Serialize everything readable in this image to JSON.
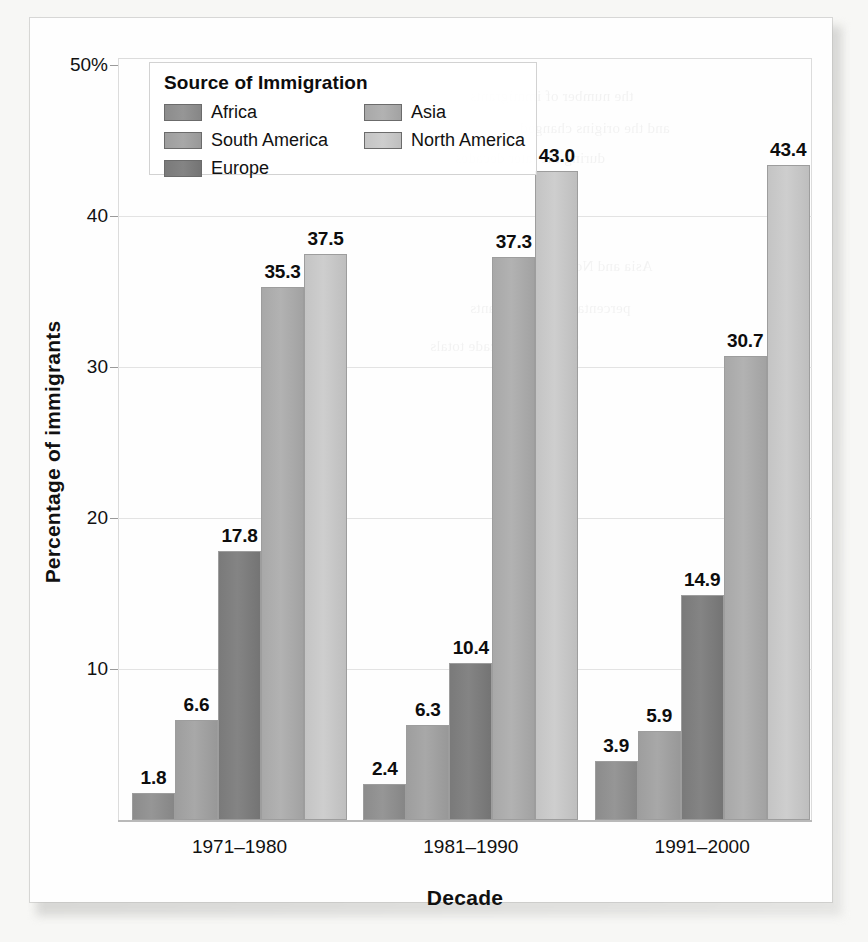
{
  "chart_data": {
    "type": "bar",
    "title": "",
    "xlabel": "Decade",
    "ylabel": "Percentage of immigrants",
    "categories": [
      "1971–1980",
      "1981–1990",
      "1991–2000"
    ],
    "legend_title": "Source of Immigration",
    "legend_position": "upper-left inside plot",
    "grid": true,
    "ylim": [
      0,
      50
    ],
    "yticks": [
      10,
      20,
      30,
      40,
      50
    ],
    "ytick_labels": [
      "10",
      "20",
      "30",
      "40",
      "50%"
    ],
    "series": [
      {
        "name": "Africa",
        "color": "#8c8c8c",
        "values": [
          1.8,
          2.4,
          3.9
        ]
      },
      {
        "name": "South America",
        "color": "#9e9e9e",
        "values": [
          6.6,
          6.3,
          5.9
        ]
      },
      {
        "name": "Europe",
        "color": "#7a7a7a",
        "values": [
          17.8,
          10.4,
          14.9
        ]
      },
      {
        "name": "Asia",
        "color": "#a8a8a8",
        "values": [
          35.3,
          37.3,
          30.7
        ]
      },
      {
        "name": "North America",
        "color": "#c4c4c4",
        "values": [
          37.5,
          43.0,
          43.4
        ]
      }
    ],
    "value_labels": [
      [
        "1.8",
        "6.6",
        "17.8",
        "35.3",
        "37.5"
      ],
      [
        "2.4",
        "6.3",
        "10.4",
        "37.3",
        "43.0"
      ],
      [
        "3.9",
        "5.9",
        "14.9",
        "30.7",
        "43.4"
      ]
    ]
  },
  "bleed_text": [
    "the number of immigrants",
    "and the origins changed",
    "during the later decades",
    "Asia and North America",
    "percentage of immigrants",
    "decade by decade totals"
  ]
}
